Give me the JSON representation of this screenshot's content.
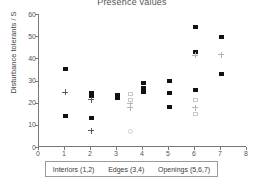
{
  "chart_data": {
    "type": "scatter",
    "title": "Presence values",
    "xlabel": "",
    "ylabel": "Disturbance tolerants / S",
    "xlim": [
      0,
      8
    ],
    "ylim": [
      0,
      60
    ],
    "xticks": [
      0,
      1,
      2,
      3,
      4,
      5,
      6,
      7,
      8
    ],
    "yticks": [
      0,
      10,
      20,
      30,
      40,
      50,
      60
    ],
    "grid": false,
    "legend_position": "below-axis",
    "group_labels": [
      "Interiors (1,2)",
      "Edges (3,4)",
      "Openings (5,6,7)"
    ],
    "series": [
      {
        "name": "filled-square-dark",
        "marker": "square-filled",
        "color": "#111111",
        "points": [
          {
            "x": 1,
            "y": 35.0
          },
          {
            "x": 1,
            "y": 13.9
          },
          {
            "x": 2,
            "y": 24.5
          },
          {
            "x": 2,
            "y": 23.1
          },
          {
            "x": 2,
            "y": 13.0
          },
          {
            "x": 3,
            "y": 23.3
          },
          {
            "x": 3,
            "y": 22.0
          },
          {
            "x": 4,
            "y": 28.7
          },
          {
            "x": 4,
            "y": 26.4
          },
          {
            "x": 4,
            "y": 24.7
          },
          {
            "x": 5,
            "y": 30.0
          },
          {
            "x": 5,
            "y": 24.5
          },
          {
            "x": 5,
            "y": 17.9
          },
          {
            "x": 6,
            "y": 54.0
          },
          {
            "x": 6,
            "y": 42.7
          },
          {
            "x": 6,
            "y": 25.7
          },
          {
            "x": 7,
            "y": 49.8
          },
          {
            "x": 7,
            "y": 33.0
          }
        ]
      },
      {
        "name": "plus-dark",
        "marker": "plus",
        "color": "#5a5a5a",
        "points": [
          {
            "x": 1,
            "y": 24.7
          },
          {
            "x": 2,
            "y": 21.3
          },
          {
            "x": 2,
            "y": 7.3
          }
        ]
      },
      {
        "name": "plus-light",
        "marker": "plus",
        "color": "#b5b5b5",
        "points": [
          {
            "x": 3.5,
            "y": 19.5
          },
          {
            "x": 3.5,
            "y": 17.8
          },
          {
            "x": 6,
            "y": 41.5
          },
          {
            "x": 6,
            "y": 17.7
          },
          {
            "x": 7,
            "y": 41.7
          }
        ]
      },
      {
        "name": "open-square-light",
        "marker": "square-open",
        "color": "#c9c9c9",
        "points": [
          {
            "x": 3.5,
            "y": 23.8
          },
          {
            "x": 3.5,
            "y": 21.3
          },
          {
            "x": 6,
            "y": 21.0
          },
          {
            "x": 6,
            "y": 15.0
          }
        ]
      },
      {
        "name": "open-circle-light",
        "marker": "circle-open",
        "color": "#cfcfcf",
        "points": [
          {
            "x": 3.5,
            "y": 6.8
          }
        ]
      }
    ]
  }
}
